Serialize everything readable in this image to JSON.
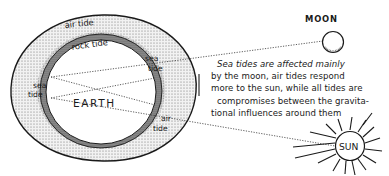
{
  "figure": {
    "type": "illustration"
  },
  "labels": {
    "air_tide_top": "air tide",
    "rock_tide": "rock tide",
    "sea_tide_right_1": "sea",
    "sea_tide_right_2": "tide",
    "sea_tide_left_1": "sea",
    "sea_tide_left_2": "tide",
    "earth": "EARTH",
    "air_tide_bottom_1": "air",
    "air_tide_bottom_2": "tide",
    "moon": "MOON",
    "sun": "SUN"
  },
  "caption": {
    "lines": [
      "Sea tides are affected mainly",
      "by the moon, air tides respond",
      "more to the sun, while all tides are",
      "compromises between the gravita-",
      "tional influences around them"
    ]
  },
  "colors": {
    "ink": "#1a1a1a",
    "air_layer": "#e4e4e4",
    "rock_layer": "#8a8a8a",
    "background": "#ffffff"
  }
}
